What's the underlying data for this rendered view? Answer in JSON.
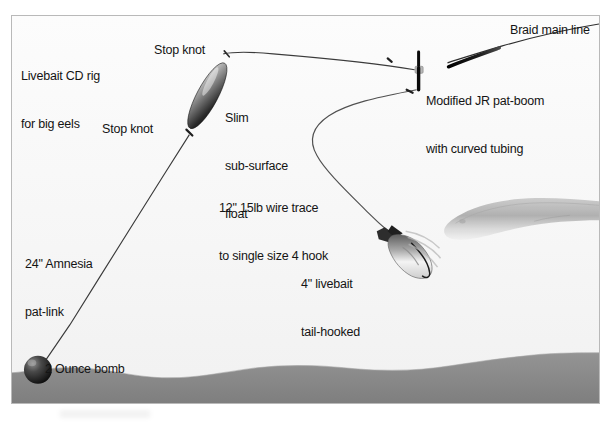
{
  "diagram": {
    "title": "Livebait CD rig for big eels",
    "type": "fishing-rig-illustration",
    "frame": {
      "border_color": "#b9b9b9",
      "background_color": "#fbfbfb"
    },
    "seabed": {
      "color": "#8c8c8c",
      "label": "seabed"
    },
    "water": {
      "color": "#f7f7f7",
      "label": "water column"
    }
  },
  "labels": {
    "rig_title_line1": "Livebait CD rig",
    "rig_title_line2": "for big eels",
    "stop_knot_upper": "Stop knot",
    "stop_knot_lower": "Stop knot",
    "float_line1": "Slim",
    "float_line2": "sub-surface",
    "float_line3": "float",
    "braid_main_line": "Braid main line",
    "boom_line1": "Modified JR pat-boom",
    "boom_line2": "with curved tubing",
    "trace_line1": "12\" 15lb wire trace",
    "trace_line2": "to single size 4 hook",
    "livebait_line1": "4\" livebait",
    "livebait_line2": "tail-hooked",
    "amnesia_line1": "24\" Amnesia",
    "amnesia_line2": "pat-link",
    "bomb": "2 Ounce bomb"
  },
  "components": [
    {
      "name": "braid-main-line",
      "label": "Braid main line",
      "color": "#2b2b2b"
    },
    {
      "name": "modified-jr-pat-boom",
      "label": "Modified JR pat-boom with curved tubing",
      "color": "#111111"
    },
    {
      "name": "slim-sub-surface-float",
      "label": "Slim sub-surface float",
      "color": "#1a1a1a"
    },
    {
      "name": "upper-stop-knot",
      "label": "Stop knot",
      "color": "#333333"
    },
    {
      "name": "lower-stop-knot",
      "label": "Stop knot",
      "color": "#333333"
    },
    {
      "name": "wire-trace",
      "label": "12\" 15lb wire trace to single size 4 hook",
      "color": "#4a4a4a"
    },
    {
      "name": "livebait-fish",
      "label": "4\" livebait tail-hooked",
      "color": "#9a9a9a"
    },
    {
      "name": "amnesia-pat-link",
      "label": "24\" Amnesia pat-link",
      "color": "#3a3a3a"
    },
    {
      "name": "lead-bomb",
      "label": "2 Ounce bomb",
      "color": "#1c1c1c"
    },
    {
      "name": "eel",
      "label": "big eel",
      "color": "#b3b3b3"
    }
  ]
}
